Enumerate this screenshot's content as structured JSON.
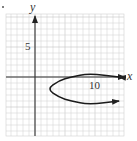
{
  "chart_data": {
    "type": "line",
    "title": "",
    "xlabel": "x",
    "ylabel": "y",
    "xlim": [
      -5,
      15
    ],
    "ylim": [
      -10,
      10
    ],
    "grid": true,
    "x_ticks_labeled": [
      {
        "value": 10,
        "label": "10"
      }
    ],
    "y_ticks_labeled": [
      {
        "value": 5,
        "label": "5"
      }
    ],
    "series": [
      {
        "name": "parabola opening right",
        "equation_estimate": "x = (y + 2)^2 + 2",
        "vertex": [
          2,
          -2
        ],
        "points": [
          [
            14,
            0
          ],
          [
            9,
            0.6
          ],
          [
            6,
            0
          ],
          [
            4,
            -0.6
          ],
          [
            2,
            -2
          ],
          [
            4,
            -3.4
          ],
          [
            6,
            -4
          ],
          [
            9,
            -4.6
          ],
          [
            14,
            -4
          ]
        ],
        "arrows_on_both_ends": true
      }
    ]
  },
  "labels": {
    "x_axis": "x",
    "y_axis": "y",
    "tick_x": "10",
    "tick_y": "5"
  }
}
